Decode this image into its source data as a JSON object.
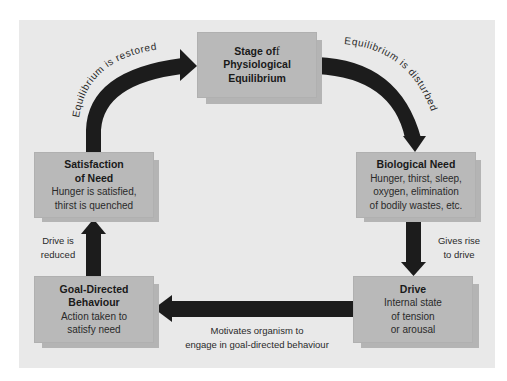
{
  "diagram": {
    "colors": {
      "panel_background": "#e9e9e9",
      "box_fill": "#b9b9b9",
      "box_shadow": "#b4b4b4",
      "arrow": "#1c1c1c",
      "text": "#1e1e1e"
    },
    "nodes": {
      "equilibrium": {
        "title_line1": "Stage of",
        "title_line1_suffix": "f",
        "title_line2": "Physiological",
        "title_line3": "Equilibrium"
      },
      "biological_need": {
        "title": "Biological Need",
        "desc_line1": "Hunger, thirst, sleep,",
        "desc_line2": "oxygen, elimination",
        "desc_line3": "of bodily wastes, etc."
      },
      "drive": {
        "title": "Drive",
        "desc_line1": "Internal state",
        "desc_line2": "of tension",
        "desc_line3": "or arousal"
      },
      "goal_directed": {
        "title_line1": "Goal-Directed",
        "title_line2": "Behaviour",
        "desc_line1": "Action taken to",
        "desc_line2": "satisfy need"
      },
      "satisfaction": {
        "title_line1": "Satisfaction",
        "title_line2": "of Need",
        "desc_line1": "Hunger is satisfied,",
        "desc_line2": "thirst is quenched"
      }
    },
    "edges": {
      "equilibrium_to_need": "Equilibrium is disturbed",
      "need_to_drive_line1": "Gives rise",
      "need_to_drive_line2": "to drive",
      "drive_to_behaviour_line1": "Motivates organism to",
      "drive_to_behaviour_line2": "engage in goal-directed behaviour",
      "behaviour_to_satisfaction_line1": "Drive is",
      "behaviour_to_satisfaction_line2": "reduced",
      "satisfaction_to_equilibrium": "Equilibrium is restored"
    }
  }
}
